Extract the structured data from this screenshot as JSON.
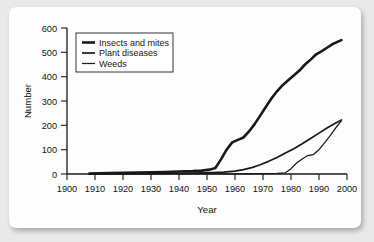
{
  "chart_data": {
    "type": "line",
    "title": "",
    "xlabel": "Year",
    "ylabel": "Number",
    "xlim": [
      1900,
      2000
    ],
    "ylim": [
      0,
      600
    ],
    "grid": false,
    "legend_position": "top-left-inside",
    "x_ticks": [
      "1900",
      "1910",
      "1920",
      "1930",
      "1940",
      "1950",
      "1960",
      "1970",
      "1980",
      "1990",
      "2000"
    ],
    "y_ticks": [
      "0",
      "100",
      "200",
      "300",
      "400",
      "500",
      "600"
    ],
    "series": [
      {
        "name": "Insects and mites",
        "stroke_width": 2.6,
        "color": "#18181a",
        "x": [
          1908,
          1915,
          1925,
          1935,
          1940,
          1945,
          1948,
          1951,
          1953,
          1955,
          1957,
          1959,
          1961,
          1963,
          1965,
          1967,
          1969,
          1971,
          1973,
          1975,
          1977,
          1979,
          1981,
          1983,
          1985,
          1987,
          1989,
          1991,
          1993,
          1995,
          1998
        ],
        "y": [
          2,
          4,
          6,
          8,
          10,
          12,
          14,
          18,
          25,
          60,
          100,
          130,
          140,
          150,
          175,
          205,
          240,
          275,
          310,
          340,
          365,
          385,
          405,
          425,
          450,
          470,
          492,
          505,
          520,
          535,
          550
        ]
      },
      {
        "name": "Plant diseases",
        "stroke_width": 1.7,
        "color": "#18181a",
        "x": [
          1908,
          1920,
          1935,
          1945,
          1952,
          1956,
          1960,
          1963,
          1966,
          1969,
          1972,
          1975,
          1978,
          1981,
          1984,
          1987,
          1990,
          1993,
          1996,
          1998
        ],
        "y": [
          1,
          2,
          3,
          4,
          6,
          8,
          12,
          18,
          26,
          38,
          52,
          68,
          86,
          104,
          124,
          146,
          168,
          190,
          210,
          222
        ]
      },
      {
        "name": "Weeds",
        "stroke_width": 1.25,
        "color": "#18181a",
        "x": [
          1908,
          1925,
          1945,
          1960,
          1970,
          1975,
          1978,
          1980,
          1982,
          1984,
          1986,
          1988,
          1990,
          1992,
          1994,
          1996,
          1998
        ],
        "y": [
          0,
          0,
          1,
          1,
          2,
          3,
          5,
          22,
          45,
          62,
          76,
          80,
          100,
          128,
          158,
          190,
          218
        ]
      }
    ]
  },
  "legend": {
    "items": [
      {
        "label": "Insects and mites"
      },
      {
        "label": "Plant diseases"
      },
      {
        "label": "Weeds"
      }
    ]
  },
  "axes": {
    "y_title": "Number",
    "x_title": "Year"
  }
}
